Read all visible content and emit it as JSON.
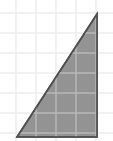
{
  "canvas": {
    "width": 113,
    "height": 141,
    "background_color": "#ffffff"
  },
  "grid": {
    "visible": true,
    "line_color": "#ececed",
    "line_color_over_fill": "#b9b9b9",
    "line_width": 1.4,
    "spacing_x": 20,
    "spacing_y": 20,
    "x_lines": [
      16,
      36,
      56,
      76,
      96
    ],
    "y_lines": [
      13,
      33,
      53,
      73,
      93,
      113,
      133
    ]
  },
  "chart_data": {
    "type": "scatter",
    "title": "",
    "subtitle": "",
    "xlabel": "",
    "ylabel": "",
    "grid": true,
    "legend_position": "none",
    "xlim": [
      0,
      113
    ],
    "ylim": [
      0,
      141
    ],
    "tick_labels_x": [],
    "tick_labels_y": [],
    "annotations": [],
    "shapes": [
      {
        "name": "right-triangle",
        "type": "polygon",
        "fill_color": "#939393",
        "stroke_color": "#4f4f4f",
        "stroke_width": 1.6,
        "right_angle_at": "bottom-right",
        "vertices": [
          {
            "label": "apex",
            "x": 97,
            "y": 14
          },
          {
            "label": "bottom-right",
            "x": 97,
            "y": 137
          },
          {
            "label": "bottom-left",
            "x": 17,
            "y": 137
          }
        ],
        "base_px": 80,
        "height_px": 123,
        "points_attr": "97,14 97,137 17,137"
      }
    ]
  },
  "figure": {
    "shape_name": "right triangle",
    "fill_color": "#939393",
    "outline_color": "#4f4f4f"
  }
}
